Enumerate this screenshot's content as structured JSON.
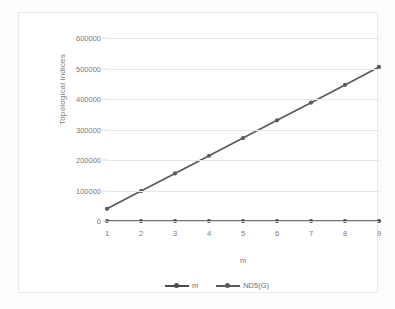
{
  "chart_data": {
    "type": "line",
    "title": "",
    "xlabel": "m",
    "ylabel": "Topological indices",
    "x": [
      1,
      2,
      3,
      4,
      5,
      6,
      7,
      8,
      9
    ],
    "xticklabels": [
      "1",
      "2",
      "3",
      "4",
      "5",
      "6",
      "7",
      "8",
      "9"
    ],
    "yticks": [
      0,
      100000,
      200000,
      300000,
      400000,
      500000,
      600000
    ],
    "yticklabels": [
      "0",
      "100000",
      "200000",
      "300000",
      "400000",
      "500000",
      "600000"
    ],
    "ylim": [
      0,
      600000
    ],
    "xlim": [
      1,
      9
    ],
    "grid": true,
    "legend_position": "bottom",
    "series": [
      {
        "name": "m",
        "values": [
          1,
          2,
          3,
          4,
          5,
          6,
          7,
          8,
          9
        ],
        "color": "#4a4a4a",
        "marker": "circle"
      },
      {
        "name": "ND5(G)",
        "values": [
          40000,
          98000,
          156000,
          214000,
          272000,
          330000,
          388000,
          446000,
          505000
        ],
        "color": "#5a5a5a",
        "marker": "circle"
      }
    ]
  },
  "legend": {
    "items": [
      {
        "label": "m"
      },
      {
        "label": "ND5(G)"
      }
    ]
  },
  "axes": {
    "x_title": "m",
    "y_title": "Topological indices"
  },
  "colors": {
    "series_line": "#5a5a5a",
    "marker": "#4a4a4a",
    "gridline": "#e6e6e6",
    "tick_text": "#7a7a7a",
    "frame": "#e9e9e9",
    "background": "#ffffff"
  }
}
